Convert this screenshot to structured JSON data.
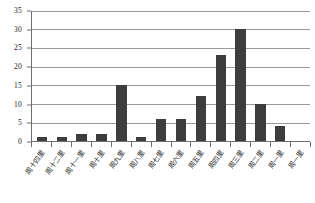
{
  "chart_data": {
    "type": "bar",
    "title": "",
    "subtitle": "",
    "xlabel": "",
    "ylabel": "",
    "ylim": [
      0,
      35
    ],
    "ytick_step": 5,
    "yticks": [
      "0",
      "5",
      "10",
      "15",
      "20",
      "25",
      "30",
      "35"
    ],
    "grid": true,
    "legend": false,
    "legend_position": "none",
    "bar_color": "#3d3d3d",
    "axis_color": "#6f6f6f",
    "gridline_color": "#9a9a9a",
    "categories": [
      "周十四里",
      "周十二里",
      "周十一里",
      "周十里",
      "周九里",
      "周八里",
      "周七里",
      "周六里",
      "周五里",
      "周四里",
      "周三里",
      "周二里",
      "周一里",
      "周一里"
    ],
    "values": [
      1,
      1,
      2,
      2,
      15,
      1,
      6,
      6,
      12,
      23,
      30,
      10,
      4,
      0
    ],
    "series": [
      {
        "name": "频次",
        "values": [
          1,
          1,
          2,
          2,
          15,
          1,
          6,
          6,
          12,
          23,
          30,
          10,
          4,
          0
        ]
      }
    ]
  }
}
